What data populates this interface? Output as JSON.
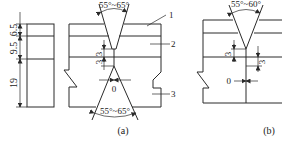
{
  "figure": {
    "side_view": {
      "dims": [
        "6.5",
        "9.5",
        "19"
      ]
    },
    "panel_a": {
      "caption": "(a)",
      "top_angle": "55°~65°",
      "bottom_angle": "55°~65°",
      "root_face_top": "3",
      "root_face_bottom": "3",
      "root_gap": "0",
      "callouts": [
        "1",
        "2",
        "3"
      ]
    },
    "panel_b": {
      "caption": "(b)",
      "top_angle": "55°~60°",
      "root_face_left": "3",
      "root_face_right": "3",
      "root_gap": "0"
    }
  }
}
